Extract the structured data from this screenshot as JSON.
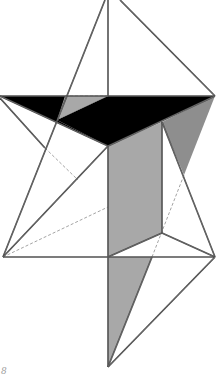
{
  "figure": {
    "colors": {
      "background": "#ffffff",
      "edge": "#3a3a3a",
      "hidden_edge": "#9a9a9a",
      "black_face": "#000000",
      "grey_face_light": "#a8a8a8",
      "grey_face_mid": "#8e8e8e",
      "grey_face_dark": "#7a7a7a"
    },
    "vertices": {
      "apex": [
        108,
        -8
      ],
      "left_band": [
        0,
        96
      ],
      "right_band": [
        215,
        96
      ],
      "band_mid": [
        108,
        96
      ],
      "grey_top_left": [
        65,
        96
      ],
      "band_cross": [
        57,
        120
      ],
      "black_low": [
        108,
        146
      ],
      "left_knee": [
        45,
        148
      ],
      "rect_top_right": [
        162,
        122
      ],
      "right_pinch": [
        184,
        175
      ],
      "rect_bottom_right": [
        162,
        233
      ],
      "left_base": [
        3,
        257
      ],
      "center_base": [
        108,
        257
      ],
      "right_base": [
        215,
        257
      ],
      "dash_base": [
        152,
        257
      ],
      "bottom_tip": [
        108,
        367
      ]
    },
    "faces": [
      {
        "name": "black-face-left",
        "fill": "black_face",
        "points": [
          [
            0,
            96
          ],
          [
            108,
            96
          ],
          [
            57,
            120
          ],
          [
            108,
            146
          ]
        ]
      },
      {
        "name": "black-face-right",
        "fill": "black_face",
        "points": [
          [
            57,
            120
          ],
          [
            108,
            96
          ],
          [
            215,
            96
          ],
          [
            108,
            146
          ]
        ]
      },
      {
        "name": "grey-face-top",
        "fill": "grey_face_light",
        "points": [
          [
            65,
            96
          ],
          [
            108,
            96
          ],
          [
            57,
            120
          ]
        ]
      },
      {
        "name": "grey-face-rect",
        "fill": "grey_face_light",
        "points": [
          [
            108,
            146
          ],
          [
            162,
            122
          ],
          [
            162,
            233
          ],
          [
            108,
            257
          ]
        ]
      },
      {
        "name": "grey-face-right",
        "fill": "grey_face_mid",
        "points": [
          [
            162,
            122
          ],
          [
            215,
            96
          ],
          [
            184,
            175
          ]
        ]
      },
      {
        "name": "grey-face-bottom",
        "fill": "grey_face_light",
        "points": [
          [
            108,
            257
          ],
          [
            152,
            257
          ],
          [
            108,
            367
          ]
        ]
      }
    ],
    "edges": [
      [
        [
          105,
          0
        ],
        [
          3,
          257
        ]
      ],
      [
        [
          108,
          0
        ],
        [
          108,
          96
        ]
      ],
      [
        [
          120,
          0
        ],
        [
          215,
          96
        ]
      ],
      [
        [
          0,
          96
        ],
        [
          215,
          96
        ]
      ],
      [
        [
          0,
          98
        ],
        [
          45,
          148
        ]
      ],
      [
        [
          0,
          96
        ],
        [
          108,
          146
        ]
      ],
      [
        [
          108,
          146
        ],
        [
          215,
          96
        ]
      ],
      [
        [
          108,
          146
        ],
        [
          3,
          257
        ]
      ],
      [
        [
          108,
          146
        ],
        [
          108,
          367
        ]
      ],
      [
        [
          162,
          122
        ],
        [
          162,
          233
        ]
      ],
      [
        [
          162,
          122
        ],
        [
          215,
          257
        ]
      ],
      [
        [
          162,
          233
        ],
        [
          108,
          257
        ]
      ],
      [
        [
          162,
          233
        ],
        [
          215,
          257
        ]
      ],
      [
        [
          3,
          257
        ],
        [
          215,
          257
        ]
      ],
      [
        [
          215,
          257
        ],
        [
          108,
          367
        ]
      ],
      [
        [
          152,
          257
        ],
        [
          108,
          367
        ]
      ]
    ],
    "hidden_edges": [
      [
        [
          65,
          96
        ],
        [
          108,
          96
        ]
      ],
      [
        [
          45,
          148
        ],
        [
          78,
          180
        ]
      ],
      [
        [
          3,
          257
        ],
        [
          108,
          207
        ]
      ],
      [
        [
          184,
          175
        ],
        [
          152,
          257
        ]
      ]
    ]
  },
  "page": {
    "number": "8"
  }
}
